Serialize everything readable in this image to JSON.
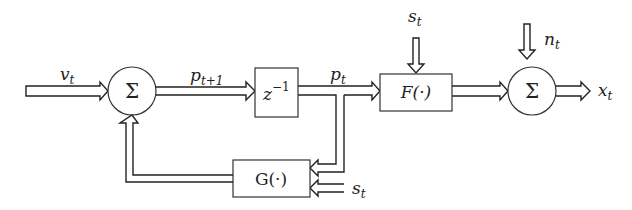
{
  "diagram": {
    "type": "block-diagram",
    "nodes": {
      "sum1": {
        "symbol": "Σ"
      },
      "delay": {
        "label": "z",
        "exp": "−1"
      },
      "F": {
        "label": "F(·)"
      },
      "G": {
        "label": "G(·)"
      },
      "sum2": {
        "symbol": "Σ"
      }
    },
    "signals": {
      "v": {
        "base": "v",
        "sub": "t"
      },
      "p_next": {
        "base": "p",
        "sub": "t+1"
      },
      "p": {
        "base": "p",
        "sub": "t"
      },
      "s_top": {
        "base": "s",
        "sub": "t"
      },
      "s_g": {
        "base": "s",
        "sub": "t"
      },
      "n": {
        "base": "n",
        "sub": "t"
      },
      "x": {
        "base": "x",
        "sub": "t"
      }
    },
    "edges": [
      {
        "from": "input",
        "to": "sum1",
        "label": "v_t"
      },
      {
        "from": "sum1",
        "to": "delay",
        "label": "p_{t+1}"
      },
      {
        "from": "delay",
        "to": "F",
        "label": "p_t"
      },
      {
        "from": "delay",
        "to": "G",
        "label": "p_t (branch)"
      },
      {
        "from": "s_t",
        "to": "F"
      },
      {
        "from": "s_t",
        "to": "G"
      },
      {
        "from": "G",
        "to": "sum1",
        "label": "feedback"
      },
      {
        "from": "F",
        "to": "sum2"
      },
      {
        "from": "n_t",
        "to": "sum2"
      },
      {
        "from": "sum2",
        "to": "output",
        "label": "x_t"
      }
    ]
  }
}
